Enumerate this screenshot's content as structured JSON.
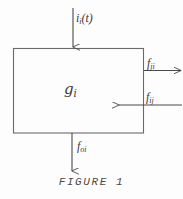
{
  "figure": {
    "caption": "FIGURE 1",
    "box": {
      "name": "system-block",
      "label_main": "g",
      "label_sub": "i"
    },
    "signals": [
      {
        "name": "input-signal",
        "label_main": "i",
        "label_sub": "i",
        "label_tail": "(t)",
        "direction": "down-into-box",
        "position": "top"
      },
      {
        "name": "outgoing-flow-right",
        "label_main": "f",
        "label_sub": "ji",
        "label_tail": "",
        "direction": "right-out-of-box",
        "position": "right-upper"
      },
      {
        "name": "incoming-flow-right",
        "label_main": "f",
        "label_sub": "ij",
        "label_tail": "",
        "direction": "left-into-box",
        "position": "right-lower"
      },
      {
        "name": "output-signal",
        "label_main": "f",
        "label_sub": "oi",
        "label_tail": "",
        "direction": "down-out-of-box",
        "position": "bottom"
      }
    ],
    "colors": {
      "ink": "#4a4a4a",
      "background": "#fdfdfd"
    }
  }
}
